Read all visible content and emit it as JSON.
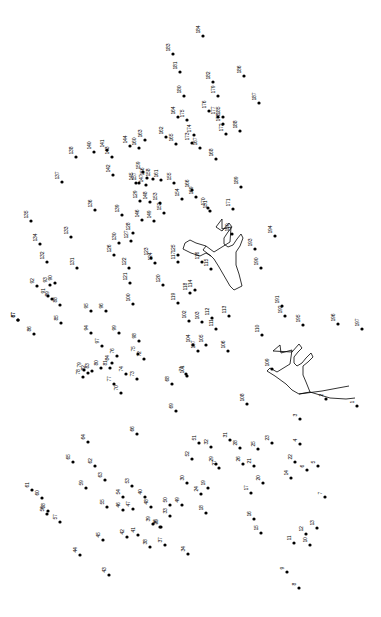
{
  "page": {
    "width": 381,
    "height": 617,
    "background_color": "#ffffff",
    "ink_color": "#000000"
  },
  "puzzle": {
    "type": "connect-the-dots",
    "dot_count": 197,
    "number_range": [
      1,
      197
    ],
    "dot_radius": 1.6,
    "label_font_size": 5.1,
    "label_rotation_deg": -90,
    "prefilled_outline_count": 2,
    "prefilled_outline_description": "two antler-like branching shapes already outlined in the center of the puzzle"
  },
  "dots": [
    {
      "n": "1",
      "x": 357,
      "y": 406
    },
    {
      "n": "2",
      "x": 326,
      "y": 399
    },
    {
      "n": "3",
      "x": 300,
      "y": 419
    },
    {
      "n": "4",
      "x": 300,
      "y": 444
    },
    {
      "n": "5",
      "x": 318,
      "y": 466
    },
    {
      "n": "6",
      "x": 307,
      "y": 470
    },
    {
      "n": "7",
      "x": 325,
      "y": 497
    },
    {
      "n": "8",
      "x": 299,
      "y": 588
    },
    {
      "n": "9",
      "x": 287,
      "y": 572
    },
    {
      "n": "10",
      "x": 310,
      "y": 545
    },
    {
      "n": "11",
      "x": 294,
      "y": 543
    },
    {
      "n": "12",
      "x": 306,
      "y": 534
    },
    {
      "n": "13",
      "x": 317,
      "y": 528
    },
    {
      "n": "14",
      "x": 291,
      "y": 478
    },
    {
      "n": "15",
      "x": 261,
      "y": 533
    },
    {
      "n": "16",
      "x": 254,
      "y": 519
    },
    {
      "n": "17",
      "x": 251,
      "y": 493
    },
    {
      "n": "18",
      "x": 206,
      "y": 513
    },
    {
      "n": "19",
      "x": 208,
      "y": 488
    },
    {
      "n": "20",
      "x": 263,
      "y": 483
    },
    {
      "n": "21",
      "x": 254,
      "y": 466
    },
    {
      "n": "22",
      "x": 295,
      "y": 462
    },
    {
      "n": "23",
      "x": 272,
      "y": 443
    },
    {
      "n": "24",
      "x": 201,
      "y": 494
    },
    {
      "n": "25",
      "x": 258,
      "y": 449
    },
    {
      "n": "26",
      "x": 243,
      "y": 464
    },
    {
      "n": "27",
      "x": 219,
      "y": 468
    },
    {
      "n": "28",
      "x": 240,
      "y": 448
    },
    {
      "n": "29",
      "x": 216,
      "y": 464
    },
    {
      "n": "30",
      "x": 187,
      "y": 483
    },
    {
      "n": "31",
      "x": 230,
      "y": 440
    },
    {
      "n": "32",
      "x": 211,
      "y": 447
    },
    {
      "n": "33",
      "x": 170,
      "y": 516
    },
    {
      "n": "34",
      "x": 188,
      "y": 554
    },
    {
      "n": "35",
      "x": 161,
      "y": 527
    },
    {
      "n": "36",
      "x": 160,
      "y": 527
    },
    {
      "n": "37",
      "x": 165,
      "y": 545
    },
    {
      "n": "38",
      "x": 150,
      "y": 547
    },
    {
      "n": "39",
      "x": 153,
      "y": 524
    },
    {
      "n": "40",
      "x": 145,
      "y": 497
    },
    {
      "n": "41",
      "x": 138,
      "y": 535
    },
    {
      "n": "42",
      "x": 127,
      "y": 537
    },
    {
      "n": "43",
      "x": 109,
      "y": 575
    },
    {
      "n": "44",
      "x": 80,
      "y": 555
    },
    {
      "n": "45",
      "x": 103,
      "y": 540
    },
    {
      "n": "46",
      "x": 123,
      "y": 510
    },
    {
      "n": "47",
      "x": 133,
      "y": 509
    },
    {
      "n": "48",
      "x": 151,
      "y": 507
    },
    {
      "n": "49",
      "x": 182,
      "y": 505
    },
    {
      "n": "50",
      "x": 170,
      "y": 505
    },
    {
      "n": "51",
      "x": 199,
      "y": 443
    },
    {
      "n": "52",
      "x": 192,
      "y": 459
    },
    {
      "n": "53",
      "x": 132,
      "y": 486
    },
    {
      "n": "54",
      "x": 123,
      "y": 497
    },
    {
      "n": "55",
      "x": 107,
      "y": 507
    },
    {
      "n": "56",
      "x": 47,
      "y": 514
    },
    {
      "n": "57",
      "x": 60,
      "y": 522
    },
    {
      "n": "58",
      "x": 48,
      "y": 511
    },
    {
      "n": "59",
      "x": 86,
      "y": 488
    },
    {
      "n": "60",
      "x": 42,
      "y": 498
    },
    {
      "n": "61",
      "x": 32,
      "y": 490
    },
    {
      "n": "62",
      "x": 95,
      "y": 466
    },
    {
      "n": "63",
      "x": 105,
      "y": 480
    },
    {
      "n": "64",
      "x": 88,
      "y": 442
    },
    {
      "n": "65",
      "x": 73,
      "y": 462
    },
    {
      "n": "66",
      "x": 137,
      "y": 434
    },
    {
      "n": "67",
      "x": 18,
      "y": 320
    },
    {
      "n": "68",
      "x": 172,
      "y": 384
    },
    {
      "n": "69",
      "x": 176,
      "y": 411
    },
    {
      "n": "70",
      "x": 121,
      "y": 393
    },
    {
      "n": "71",
      "x": 186,
      "y": 374
    },
    {
      "n": "72",
      "x": 144,
      "y": 359
    },
    {
      "n": "73",
      "x": 137,
      "y": 379
    },
    {
      "n": "74",
      "x": 126,
      "y": 374
    },
    {
      "n": "75",
      "x": 138,
      "y": 354
    },
    {
      "n": "76",
      "x": 117,
      "y": 356
    },
    {
      "n": "77",
      "x": 114,
      "y": 384
    },
    {
      "n": "78",
      "x": 83,
      "y": 377
    },
    {
      "n": "79",
      "x": 84,
      "y": 370
    },
    {
      "n": "80",
      "x": 101,
      "y": 368
    },
    {
      "n": "81",
      "x": 110,
      "y": 368
    },
    {
      "n": "82",
      "x": 88,
      "y": 373
    },
    {
      "n": "83",
      "x": 92,
      "y": 371
    },
    {
      "n": "84",
      "x": 112,
      "y": 363
    },
    {
      "n": "85",
      "x": 61,
      "y": 323
    },
    {
      "n": "86",
      "x": 34,
      "y": 334
    },
    {
      "n": "87",
      "x": 18,
      "y": 320
    },
    {
      "n": "88",
      "x": 60,
      "y": 305
    },
    {
      "n": "89",
      "x": 52,
      "y": 299
    },
    {
      "n": "90",
      "x": 55,
      "y": 283
    },
    {
      "n": "91",
      "x": 48,
      "y": 296
    },
    {
      "n": "92",
      "x": 37,
      "y": 286
    },
    {
      "n": "93",
      "x": 50,
      "y": 285
    },
    {
      "n": "94",
      "x": 91,
      "y": 333
    },
    {
      "n": "95",
      "x": 91,
      "y": 311
    },
    {
      "n": "96",
      "x": 106,
      "y": 311
    },
    {
      "n": "97",
      "x": 102,
      "y": 346
    },
    {
      "n": "98",
      "x": 139,
      "y": 341
    },
    {
      "n": "99",
      "x": 119,
      "y": 333
    },
    {
      "n": "100",
      "x": 133,
      "y": 304
    },
    {
      "n": "101",
      "x": 187,
      "y": 376
    },
    {
      "n": "102",
      "x": 189,
      "y": 321
    },
    {
      "n": "103",
      "x": 202,
      "y": 322
    },
    {
      "n": "104",
      "x": 193,
      "y": 345
    },
    {
      "n": "105",
      "x": 206,
      "y": 345
    },
    {
      "n": "106",
      "x": 228,
      "y": 351
    },
    {
      "n": "107",
      "x": 198,
      "y": 351
    },
    {
      "n": "108",
      "x": 247,
      "y": 404
    },
    {
      "n": "109",
      "x": 272,
      "y": 369
    },
    {
      "n": "110",
      "x": 262,
      "y": 335
    },
    {
      "n": "111",
      "x": 216,
      "y": 329
    },
    {
      "n": "112",
      "x": 212,
      "y": 318
    },
    {
      "n": "113",
      "x": 229,
      "y": 316
    },
    {
      "n": "114",
      "x": 195,
      "y": 290
    },
    {
      "n": "115",
      "x": 211,
      "y": 269
    },
    {
      "n": "116",
      "x": 202,
      "y": 262
    },
    {
      "n": "117",
      "x": 178,
      "y": 262
    },
    {
      "n": "118",
      "x": 190,
      "y": 293
    },
    {
      "n": "119",
      "x": 178,
      "y": 303
    },
    {
      "n": "120",
      "x": 163,
      "y": 285
    },
    {
      "n": "121",
      "x": 130,
      "y": 283
    },
    {
      "n": "122",
      "x": 129,
      "y": 268
    },
    {
      "n": "123",
      "x": 151,
      "y": 258
    },
    {
      "n": "124",
      "x": 155,
      "y": 263
    },
    {
      "n": "125",
      "x": 178,
      "y": 255
    },
    {
      "n": "126",
      "x": 114,
      "y": 255
    },
    {
      "n": "127",
      "x": 131,
      "y": 241
    },
    {
      "n": "128",
      "x": 133,
      "y": 233
    },
    {
      "n": "129",
      "x": 140,
      "y": 201
    },
    {
      "n": "130",
      "x": 119,
      "y": 243
    },
    {
      "n": "131",
      "x": 77,
      "y": 268
    },
    {
      "n": "132",
      "x": 47,
      "y": 262
    },
    {
      "n": "133",
      "x": 71,
      "y": 237
    },
    {
      "n": "134",
      "x": 40,
      "y": 244
    },
    {
      "n": "135",
      "x": 31,
      "y": 221
    },
    {
      "n": "136",
      "x": 95,
      "y": 210
    },
    {
      "n": "137",
      "x": 62,
      "y": 182
    },
    {
      "n": "138",
      "x": 76,
      "y": 157
    },
    {
      "n": "139",
      "x": 122,
      "y": 215
    },
    {
      "n": "140",
      "x": 94,
      "y": 152
    },
    {
      "n": "141",
      "x": 107,
      "y": 150
    },
    {
      "n": "142",
      "x": 113,
      "y": 175
    },
    {
      "n": "143",
      "x": 112,
      "y": 157
    },
    {
      "n": "144",
      "x": 130,
      "y": 146
    },
    {
      "n": "145",
      "x": 136,
      "y": 183
    },
    {
      "n": "146",
      "x": 142,
      "y": 220
    },
    {
      "n": "147",
      "x": 146,
      "y": 185
    },
    {
      "n": "148",
      "x": 150,
      "y": 202
    },
    {
      "n": "149",
      "x": 154,
      "y": 221
    },
    {
      "n": "150",
      "x": 232,
      "y": 234
    },
    {
      "n": "151",
      "x": 210,
      "y": 211
    },
    {
      "n": "152",
      "x": 164,
      "y": 213
    },
    {
      "n": "153",
      "x": 160,
      "y": 203
    },
    {
      "n": "154",
      "x": 182,
      "y": 199
    },
    {
      "n": "155",
      "x": 174,
      "y": 183
    },
    {
      "n": "156",
      "x": 147,
      "y": 178
    },
    {
      "n": "157",
      "x": 139,
      "y": 183
    },
    {
      "n": "158",
      "x": 153,
      "y": 179
    },
    {
      "n": "159",
      "x": 143,
      "y": 172
    },
    {
      "n": "160",
      "x": 139,
      "y": 148
    },
    {
      "n": "161",
      "x": 161,
      "y": 180
    },
    {
      "n": "162",
      "x": 166,
      "y": 137
    },
    {
      "n": "163",
      "x": 145,
      "y": 140
    },
    {
      "n": "164",
      "x": 178,
      "y": 117
    },
    {
      "n": "165",
      "x": 176,
      "y": 144
    },
    {
      "n": "166",
      "x": 192,
      "y": 190
    },
    {
      "n": "167",
      "x": 200,
      "y": 148
    },
    {
      "n": "168",
      "x": 216,
      "y": 159
    },
    {
      "n": "169",
      "x": 196,
      "y": 197
    },
    {
      "n": "170",
      "x": 208,
      "y": 208
    },
    {
      "n": "171",
      "x": 233,
      "y": 209
    },
    {
      "n": "172",
      "x": 226,
      "y": 134
    },
    {
      "n": "173",
      "x": 192,
      "y": 143
    },
    {
      "n": "174",
      "x": 194,
      "y": 135
    },
    {
      "n": "175",
      "x": 187,
      "y": 120
    },
    {
      "n": "176",
      "x": 209,
      "y": 111
    },
    {
      "n": "177",
      "x": 218,
      "y": 117
    },
    {
      "n": "178",
      "x": 223,
      "y": 124
    },
    {
      "n": "179",
      "x": 218,
      "y": 96
    },
    {
      "n": "180",
      "x": 184,
      "y": 96
    },
    {
      "n": "181",
      "x": 180,
      "y": 72
    },
    {
      "n": "182",
      "x": 213,
      "y": 82
    },
    {
      "n": "183",
      "x": 173,
      "y": 54
    },
    {
      "n": "184",
      "x": 203,
      "y": 36
    },
    {
      "n": "185",
      "x": 223,
      "y": 117
    },
    {
      "n": "186",
      "x": 244,
      "y": 76
    },
    {
      "n": "187",
      "x": 259,
      "y": 103
    },
    {
      "n": "188",
      "x": 240,
      "y": 131
    },
    {
      "n": "189",
      "x": 241,
      "y": 187
    },
    {
      "n": "190",
      "x": 261,
      "y": 268
    },
    {
      "n": "191",
      "x": 282,
      "y": 306
    },
    {
      "n": "192",
      "x": 285,
      "y": 316
    },
    {
      "n": "193",
      "x": 255,
      "y": 249
    },
    {
      "n": "194",
      "x": 275,
      "y": 236
    },
    {
      "n": "195",
      "x": 303,
      "y": 325
    },
    {
      "n": "196",
      "x": 338,
      "y": 324
    },
    {
      "n": "197",
      "x": 362,
      "y": 329
    }
  ],
  "outlines": [
    {
      "name": "upper-antler",
      "path": "M 216 227 L 222 219 L 222 229 L 231 227 L 230 242 L 214 252 L 206 246 L 203 250 L 211 256 L 214 259 L 219 267 L 230 286 L 234 290 L 242 286 L 239 274 L 236 265 L 236 252 L 240 246 L 243 238 L 241 234 L 237 239 L 233 245 L 228 247 L 224 244 L 224 238 L 228 232 L 232 227 L 229 223 L 222 231 Z"
    },
    {
      "name": "upper-antler-left-branch",
      "path": "M 206 246 L 196 243 L 190 240 L 185 243 L 183 249 L 191 253 L 200 256 L 206 253 L 211 256"
    },
    {
      "name": "lower-antler",
      "path": "M 273 351 L 280 345 L 281 353 L 292 350 L 290 364 L 277 372 L 270 368 L 267 371 L 275 376 L 286 384 L 292 390 L 299 394 L 310 392 L 306 382 L 303 375 L 303 366 L 308 362 L 313 357 L 311 353 L 306 358 L 302 363 L 297 366 L 294 363 L 294 357 L 298 352 L 302 348 L 299 344 L 292 352 Z"
    },
    {
      "name": "lower-antler-right-branch",
      "path": "M 299 394 L 322 391 L 338 388 L 349 386 M 310 392 L 330 398 L 346 399 L 355 398"
    }
  ]
}
